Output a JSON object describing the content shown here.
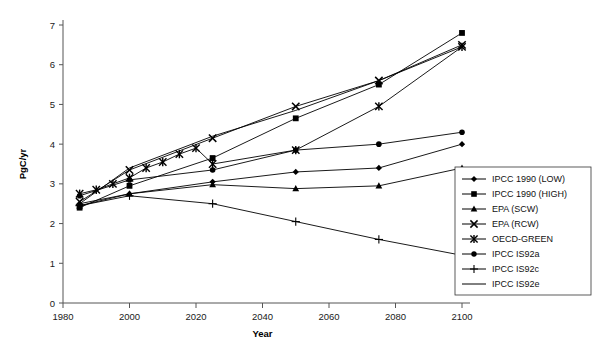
{
  "chart_data": {
    "type": "line",
    "title": "",
    "xlabel": "Year",
    "ylabel": "PgC/yr",
    "xlim": [
      1980,
      2100
    ],
    "ylim": [
      0,
      7
    ],
    "xticks": [
      1980,
      2000,
      2020,
      2040,
      2060,
      2080,
      2100
    ],
    "yticks": [
      0,
      1,
      2,
      3,
      4,
      5,
      6,
      7
    ],
    "grid": false,
    "legend_position": "right-bottom",
    "series": [
      {
        "name": "IPCC 1990 (LOW)",
        "marker": "diamond",
        "x": [
          1985,
          2000,
          2025,
          2050,
          2075,
          2100
        ],
        "values": [
          2.5,
          2.75,
          3.05,
          3.3,
          3.4,
          4.0
        ]
      },
      {
        "name": "IPCC 1990 (HIGH)",
        "marker": "square",
        "x": [
          1985,
          2000,
          2025,
          2050,
          2075,
          2100
        ],
        "values": [
          2.4,
          2.95,
          3.65,
          4.65,
          5.5,
          6.8
        ]
      },
      {
        "name": "EPA (SCW)",
        "marker": "triangle",
        "x": [
          1985,
          2000,
          2025,
          2050,
          2075,
          2100
        ],
        "values": [
          2.45,
          2.75,
          2.98,
          2.88,
          2.95,
          3.4
        ]
      },
      {
        "name": "EPA (RCW)",
        "marker": "cross-x",
        "x": [
          1985,
          2000,
          2025,
          2050,
          2075,
          2100
        ],
        "values": [
          2.55,
          3.35,
          4.15,
          4.95,
          5.6,
          6.5
        ]
      },
      {
        "name": "OECD-GREEN",
        "marker": "star",
        "x": [
          1985,
          1990,
          1995,
          2000,
          2005,
          2010,
          2015,
          2020,
          2025,
          2050,
          2075,
          2100
        ],
        "values": [
          2.75,
          2.85,
          3.0,
          3.15,
          3.4,
          3.55,
          3.75,
          3.9,
          3.5,
          3.85,
          4.95,
          6.45
        ]
      },
      {
        "name": "IPCC IS92a",
        "marker": "filled-circle",
        "x": [
          1985,
          2000,
          2025,
          2050,
          2075,
          2100
        ],
        "values": [
          2.7,
          3.1,
          3.35,
          3.85,
          4.0,
          4.3
        ]
      },
      {
        "name": "IPCC IS92c",
        "marker": "plus",
        "x": [
          1985,
          2000,
          2025,
          2050,
          2075,
          2100
        ],
        "values": [
          2.45,
          2.7,
          2.5,
          2.05,
          1.6,
          1.2
        ]
      },
      {
        "name": "IPCC IS92e",
        "marker": "none",
        "x": [
          1985,
          2000,
          2025,
          2050,
          2075,
          2100
        ],
        "values": [
          2.5,
          3.4,
          4.2,
          4.85,
          5.6,
          6.45
        ]
      }
    ]
  },
  "axes": {
    "x_title": "Year",
    "y_title": "PgC/yr",
    "x_tick_labels": [
      "1980",
      "2000",
      "2020",
      "2040",
      "2060",
      "2080",
      "2100"
    ],
    "y_tick_labels": [
      "0",
      "1",
      "2",
      "3",
      "4",
      "5",
      "6",
      "7"
    ]
  },
  "legend": {
    "items": [
      {
        "label": "IPCC 1990 (LOW)",
        "marker": "diamond"
      },
      {
        "label": "IPCC 1990 (HIGH)",
        "marker": "square"
      },
      {
        "label": "EPA (SCW)",
        "marker": "triangle"
      },
      {
        "label": "EPA (RCW)",
        "marker": "cross-x"
      },
      {
        "label": "OECD-GREEN",
        "marker": "star"
      },
      {
        "label": "IPCC IS92a",
        "marker": "filled-circle"
      },
      {
        "label": "IPCC IS92c",
        "marker": "plus"
      },
      {
        "label": "IPCC IS92e",
        "marker": "none"
      }
    ]
  },
  "colors": {
    "ink": "#000000",
    "axis": "#555555",
    "background": "#ffffff"
  }
}
